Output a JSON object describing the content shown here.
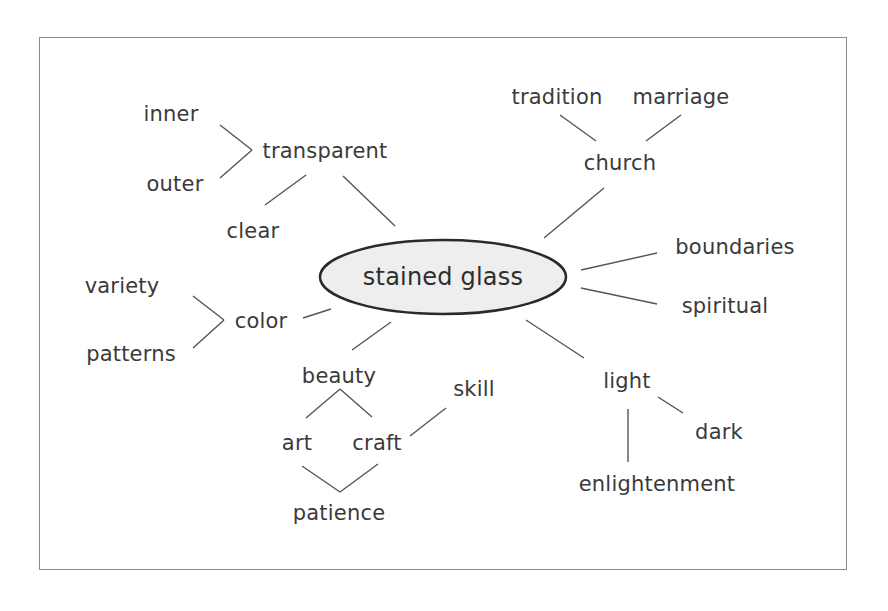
{
  "diagram": {
    "type": "mind-map",
    "center": {
      "label": "stained glass",
      "x": 443,
      "y": 277,
      "rx": 123,
      "ry": 37,
      "fill": "#eeeeee",
      "stroke": "#2a2a2a"
    },
    "nodes": {
      "inner": {
        "label": "inner",
        "x": 171,
        "y": 114
      },
      "outer": {
        "label": "outer",
        "x": 175,
        "y": 184
      },
      "transparent": {
        "label": "transparent",
        "x": 325,
        "y": 151
      },
      "clear": {
        "label": "clear",
        "x": 253,
        "y": 231
      },
      "tradition": {
        "label": "tradition",
        "x": 557,
        "y": 97
      },
      "marriage": {
        "label": "marriage",
        "x": 681,
        "y": 97
      },
      "church": {
        "label": "church",
        "x": 620,
        "y": 163
      },
      "boundaries": {
        "label": "boundaries",
        "x": 735,
        "y": 247
      },
      "spiritual": {
        "label": "spiritual",
        "x": 725,
        "y": 306
      },
      "variety": {
        "label": "variety",
        "x": 122,
        "y": 286
      },
      "patterns": {
        "label": "patterns",
        "x": 131,
        "y": 354
      },
      "color": {
        "label": "color",
        "x": 261,
        "y": 321
      },
      "beauty": {
        "label": "beauty",
        "x": 339,
        "y": 376
      },
      "skill": {
        "label": "skill",
        "x": 474,
        "y": 389
      },
      "art": {
        "label": "art",
        "x": 297,
        "y": 443
      },
      "craft": {
        "label": "craft",
        "x": 377,
        "y": 443
      },
      "patience": {
        "label": "patience",
        "x": 339,
        "y": 513
      },
      "light": {
        "label": "light",
        "x": 627,
        "y": 381
      },
      "dark": {
        "label": "dark",
        "x": 719,
        "y": 432
      },
      "enlightenment": {
        "label": "enlightenment",
        "x": 657,
        "y": 484
      }
    },
    "links": [
      {
        "from": "transparent",
        "to": "inner",
        "x1": 252,
        "y1": 150,
        "x2": 220,
        "y2": 125
      },
      {
        "from": "transparent",
        "to": "outer",
        "x1": 252,
        "y1": 150,
        "x2": 220,
        "y2": 178
      },
      {
        "from": "transparent",
        "to": "clear",
        "x1": 306,
        "y1": 175,
        "x2": 265,
        "y2": 205
      },
      {
        "from": "center",
        "to": "transparent",
        "x1": 395,
        "y1": 226,
        "x2": 343,
        "y2": 176
      },
      {
        "from": "church",
        "to": "tradition",
        "x1": 596,
        "y1": 141,
        "x2": 560,
        "y2": 115
      },
      {
        "from": "church",
        "to": "marriage",
        "x1": 646,
        "y1": 141,
        "x2": 681,
        "y2": 115
      },
      {
        "from": "center",
        "to": "church",
        "x1": 544,
        "y1": 238,
        "x2": 604,
        "y2": 188
      },
      {
        "from": "center",
        "to": "boundaries",
        "x1": 581,
        "y1": 270,
        "x2": 657,
        "y2": 253
      },
      {
        "from": "center",
        "to": "spiritual",
        "x1": 581,
        "y1": 288,
        "x2": 657,
        "y2": 304
      },
      {
        "from": "color",
        "to": "variety",
        "x1": 224,
        "y1": 320,
        "x2": 193,
        "y2": 296
      },
      {
        "from": "color",
        "to": "patterns",
        "x1": 224,
        "y1": 320,
        "x2": 193,
        "y2": 348
      },
      {
        "from": "center",
        "to": "color",
        "x1": 331,
        "y1": 309,
        "x2": 303,
        "y2": 318
      },
      {
        "from": "center",
        "to": "beauty",
        "x1": 391,
        "y1": 322,
        "x2": 352,
        "y2": 350
      },
      {
        "from": "beauty",
        "to": "art",
        "x1": 340,
        "y1": 389,
        "x2": 306,
        "y2": 418
      },
      {
        "from": "beauty",
        "to": "craft",
        "x1": 340,
        "y1": 389,
        "x2": 372,
        "y2": 417
      },
      {
        "from": "craft",
        "to": "skill",
        "x1": 410,
        "y1": 436,
        "x2": 446,
        "y2": 408
      },
      {
        "from": "art",
        "to": "patience",
        "x1": 302,
        "y1": 466,
        "x2": 340,
        "y2": 492
      },
      {
        "from": "craft",
        "to": "patience",
        "x1": 378,
        "y1": 464,
        "x2": 340,
        "y2": 492
      },
      {
        "from": "center",
        "to": "light",
        "x1": 526,
        "y1": 320,
        "x2": 584,
        "y2": 358
      },
      {
        "from": "light",
        "to": "dark",
        "x1": 658,
        "y1": 397,
        "x2": 683,
        "y2": 413
      },
      {
        "from": "light",
        "to": "enlightenment",
        "x1": 628,
        "y1": 409,
        "x2": 628,
        "y2": 462
      }
    ],
    "colors": {
      "line": "#555555",
      "text": "#3a3a3a",
      "frame": "#8a8a8a"
    }
  }
}
